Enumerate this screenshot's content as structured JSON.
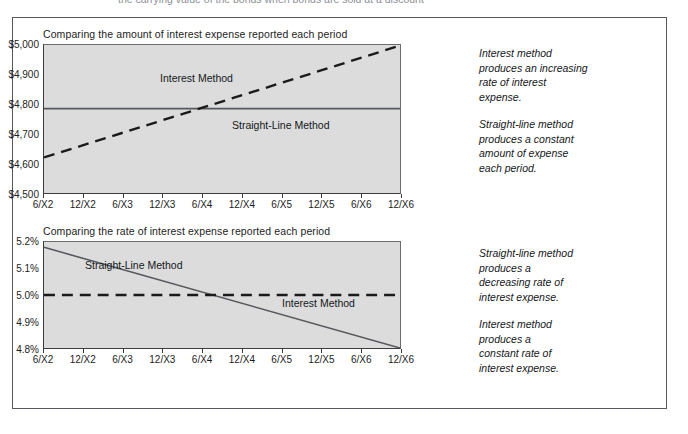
{
  "top_clipped_text": "the carrying value of the bonds when bonds are sold at a discount",
  "panels": [
    {
      "title": "Comparing the amount of interest expense reported each period",
      "series_labels": {
        "interest": "Interest Method",
        "straight_line": "Straight-Line Method"
      },
      "annotations": [
        "Interest method\nproduces an increasing\nrate of interest\nexpense.",
        "Straight-line method\nproduces a constant\namount of expense\neach period."
      ]
    },
    {
      "title": "Comparing the rate of interest expense reported each period",
      "series_labels": {
        "straight_line": "Straight-Line Method",
        "interest": "Interest Method"
      },
      "annotations": [
        "Straight-line method\nproduces a\ndecreasing rate of\ninterest expense.",
        "Interest method\nproduces a\nconstant rate of\ninterest expense."
      ]
    }
  ],
  "chart_data": [
    {
      "type": "line",
      "title": "Comparing the amount of interest expense reported each period",
      "xlabel": "",
      "ylabel": "",
      "x": [
        "6/X2",
        "12/X2",
        "6/X3",
        "12/X3",
        "6/X4",
        "12/X4",
        "6/X5",
        "12/X5",
        "6/X6",
        "12/X6"
      ],
      "ytick_labels": [
        "$5,000",
        "$4,900",
        "$4,800",
        "$4,700",
        "$4,600",
        "$4,500"
      ],
      "ytick_values": [
        5000,
        4900,
        4800,
        4700,
        4600,
        4500
      ],
      "ylim": [
        4500,
        5000
      ],
      "grid": false,
      "legend": "in-plot labels",
      "series": [
        {
          "name": "Interest Method",
          "style": "dashed",
          "color": "#1a1a1a",
          "values": [
            4620,
            4662,
            4704,
            4746,
            4788,
            4830,
            4872,
            4914,
            4956,
            4998
          ]
        },
        {
          "name": "Straight-Line Method",
          "style": "solid",
          "color": "#55585c",
          "values": [
            4785,
            4785,
            4785,
            4785,
            4785,
            4785,
            4785,
            4785,
            4785,
            4785
          ]
        }
      ],
      "crossover": "6/X4"
    },
    {
      "type": "line",
      "title": "Comparing the rate of interest expense reported each period",
      "xlabel": "",
      "ylabel": "",
      "x": [
        "6/X2",
        "12/X2",
        "6/X3",
        "12/X3",
        "6/X4",
        "12/X4",
        "6/X5",
        "12/X5",
        "6/X6",
        "12/X6"
      ],
      "ytick_labels": [
        "5.2%",
        "5.1%",
        "5.0%",
        "4.9%",
        "4.8%"
      ],
      "ytick_values": [
        5.2,
        5.1,
        5.0,
        4.9,
        4.8
      ],
      "ylim": [
        4.8,
        5.2
      ],
      "grid": false,
      "legend": "in-plot labels",
      "series": [
        {
          "name": "Straight-Line Method",
          "style": "solid",
          "color": "#55585c",
          "values": [
            5.18,
            5.138,
            5.095,
            5.053,
            5.01,
            4.968,
            4.925,
            4.883,
            4.84,
            4.8
          ]
        },
        {
          "name": "Interest Method",
          "style": "dashed",
          "color": "#1a1a1a",
          "values": [
            5.0,
            5.0,
            5.0,
            5.0,
            5.0,
            5.0,
            5.0,
            5.0,
            5.0,
            5.0
          ]
        }
      ],
      "crossover": "6/X4"
    }
  ]
}
